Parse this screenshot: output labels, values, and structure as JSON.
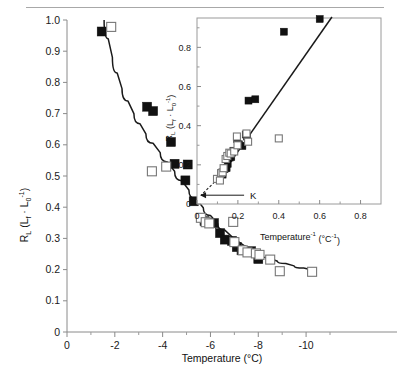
{
  "figure": {
    "background": "#ffffff",
    "line_color": "#1a1a1a",
    "marker_filled_color": "#111111",
    "marker_open_color": "#ffffff",
    "marker_open_edge": "#777777",
    "top_rule": true
  },
  "chart_data": [
    {
      "id": "main",
      "type": "scatter",
      "title": "",
      "xlabel": "Temperature (°C)",
      "ylabel": "R_L (L_f · L_0⁻¹)",
      "ylabel_parts": {
        "base": "R",
        "base_sub": "L",
        "paren_open": " (L",
        "f_sub": "f",
        "middot": " · L",
        "zero_sub": "0",
        "exp": "-1",
        "paren_close": ")"
      },
      "xlim": [
        0,
        -11
      ],
      "ylim": [
        0,
        1.0
      ],
      "x_ticks": [
        0,
        -2,
        -4,
        -6,
        -8,
        -10
      ],
      "x_tick_labels": [
        "0",
        "-2",
        "-4",
        "-6",
        "-8",
        "-10"
      ],
      "x_minor_ticks": [
        -1,
        -3,
        -5,
        -7,
        -9,
        -11
      ],
      "y_ticks": [
        0,
        0.1,
        0.2,
        0.3,
        0.4,
        0.5,
        0.6,
        0.7,
        0.8,
        0.9,
        1.0
      ],
      "y_tick_labels": [
        "0",
        "0.1",
        "0.2",
        "0.3",
        "0.4",
        "0.5",
        "0.6",
        "0.7",
        "0.8",
        "0.9",
        "1.0"
      ],
      "grid": false,
      "legend": "none",
      "series": [
        {
          "name": "filled squares",
          "marker": "filled-square",
          "points": [
            [
              -1.45,
              0.963
            ],
            [
              -3.35,
              0.722
            ],
            [
              -3.6,
              0.708
            ],
            [
              -4.35,
              0.609
            ],
            [
              -4.5,
              0.539
            ],
            [
              -4.95,
              0.486
            ],
            [
              -5.3,
              0.419
            ],
            [
              -5.05,
              0.537
            ],
            [
              -5.75,
              0.355
            ],
            [
              -6.15,
              0.349
            ],
            [
              -6.4,
              0.317
            ],
            [
              -6.6,
              0.296
            ],
            [
              -6.9,
              0.292
            ],
            [
              -7.1,
              0.272
            ],
            [
              -7.3,
              0.262
            ],
            [
              -7.7,
              0.259
            ],
            [
              -8.0,
              0.234
            ]
          ]
        },
        {
          "name": "open squares",
          "marker": "open-square",
          "points": [
            [
              -1.85,
              0.978
            ],
            [
              -4.15,
              0.53
            ],
            [
              -3.55,
              0.515
            ],
            [
              -5.6,
              0.366
            ],
            [
              -5.8,
              0.352
            ],
            [
              -5.95,
              0.348
            ],
            [
              -6.95,
              0.353
            ],
            [
              -7.0,
              0.288
            ],
            [
              -7.35,
              0.262
            ],
            [
              -7.55,
              0.255
            ],
            [
              -7.9,
              0.252
            ],
            [
              -8.05,
              0.247
            ],
            [
              -8.5,
              0.232
            ],
            [
              -8.9,
              0.195
            ],
            [
              -10.25,
              0.193
            ]
          ]
        }
      ],
      "fit_curve": {
        "description": "decaying curve through data",
        "points": [
          [
            -1.55,
            1.0
          ],
          [
            -1.9,
            0.88
          ],
          [
            -2.3,
            0.78
          ],
          [
            -2.8,
            0.7
          ],
          [
            -3.3,
            0.635
          ],
          [
            -3.9,
            0.575
          ],
          [
            -4.5,
            0.515
          ],
          [
            -5.1,
            0.455
          ],
          [
            -5.7,
            0.398
          ],
          [
            -6.3,
            0.348
          ],
          [
            -6.9,
            0.305
          ],
          [
            -7.5,
            0.272
          ],
          [
            -8.1,
            0.248
          ],
          [
            -8.8,
            0.227
          ],
          [
            -9.5,
            0.212
          ],
          [
            -10.3,
            0.198
          ]
        ]
      }
    },
    {
      "id": "inset",
      "type": "scatter",
      "title": "",
      "xlabel": "Temperature⁻¹ (°C⁻¹)",
      "ylabel": "R_L (L_f · L_0⁻¹)",
      "xlim": [
        0,
        0.9
      ],
      "ylim": [
        0,
        0.95
      ],
      "x_ticks": [
        0,
        0.2,
        0.4,
        0.6,
        0.8
      ],
      "x_tick_labels": [
        "0",
        "0.2",
        "0.4",
        "0.6",
        "0.8"
      ],
      "x_minor_ticks": [
        0.1,
        0.3,
        0.5,
        0.7
      ],
      "y_ticks": [
        0,
        0.2,
        0.4,
        0.6,
        0.8
      ],
      "y_tick_labels": [
        "0",
        "0.2",
        "0.4",
        "0.6",
        "0.8"
      ],
      "y_minor_ticks": [
        0.1,
        0.3,
        0.5,
        0.7,
        0.9
      ],
      "grid": false,
      "legend": "none",
      "annotation": {
        "label": "K",
        "description": "dashed extrapolation of fit to x-intercept, arrow pointing left to K intercept",
        "intercept_x": 0.02,
        "intercept_y": 0.045
      },
      "series": [
        {
          "name": "filled squares",
          "marker": "filled-square",
          "points": [
            [
              0.125,
              0.15
            ],
            [
              0.135,
              0.178
            ],
            [
              0.145,
              0.183
            ],
            [
              0.15,
              0.205
            ],
            [
              0.152,
              0.235
            ],
            [
              0.16,
              0.237
            ],
            [
              0.168,
              0.24
            ],
            [
              0.178,
              0.272
            ],
            [
              0.196,
              0.332
            ],
            [
              0.205,
              0.305
            ],
            [
              0.222,
              0.296
            ],
            [
              0.238,
              0.355
            ],
            [
              0.245,
              0.345
            ],
            [
              0.252,
              0.528
            ],
            [
              0.285,
              0.535
            ],
            [
              0.425,
              0.88
            ],
            [
              0.6,
              0.945
            ]
          ]
        },
        {
          "name": "open squares",
          "marker": "open-square",
          "points": [
            [
              0.098,
              0.128
            ],
            [
              0.112,
              0.12
            ],
            [
              0.118,
              0.158
            ],
            [
              0.125,
              0.162
            ],
            [
              0.13,
              0.183
            ],
            [
              0.14,
              0.23
            ],
            [
              0.148,
              0.245
            ],
            [
              0.158,
              0.262
            ],
            [
              0.165,
              0.258
            ],
            [
              0.182,
              0.268
            ],
            [
              0.195,
              0.345
            ],
            [
              0.198,
              0.3
            ],
            [
              0.242,
              0.36
            ],
            [
              0.25,
              0.318
            ],
            [
              0.4,
              0.335
            ]
          ]
        }
      ],
      "fit_line": {
        "description": "linear fit",
        "x0": 0.118,
        "y0": 0.145,
        "x1": 0.66,
        "y1": 0.955
      }
    }
  ]
}
